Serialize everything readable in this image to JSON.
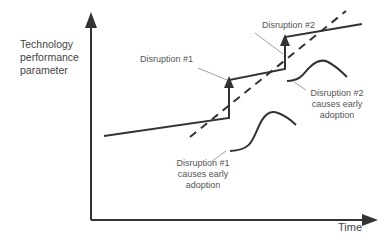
{
  "diagram": {
    "y_axis_label": "Technology performance parameter",
    "x_axis_label": "Time",
    "annotations": {
      "disruption1": "Disruption #1",
      "disruption2": "Disruption #2",
      "disruption1_adoption": "Disruption #1 causes early adoption",
      "disruption2_adoption": "Disruption #2 causes early adoption"
    },
    "series": [
      {
        "name": "performance-step-line",
        "style": "solid"
      },
      {
        "name": "trend-line",
        "style": "dashed"
      },
      {
        "name": "adoption-curve-1",
        "style": "solid"
      },
      {
        "name": "adoption-curve-2",
        "style": "solid"
      }
    ],
    "colors": {
      "line": "#333333",
      "text": "#555555",
      "leader": "#888888"
    }
  }
}
